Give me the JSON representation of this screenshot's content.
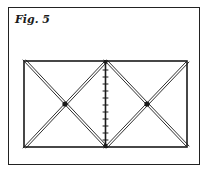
{
  "figure": {
    "label": "Fig. 5"
  },
  "diagram": {
    "rectangle": {
      "x": 24,
      "y": 61,
      "width": 163,
      "height": 86
    },
    "divider_x": 105,
    "tick_count": 11,
    "centers": [
      {
        "x": 64,
        "y": 104
      },
      {
        "x": 146,
        "y": 104
      }
    ],
    "stroke_color": "#1a1a1a"
  }
}
